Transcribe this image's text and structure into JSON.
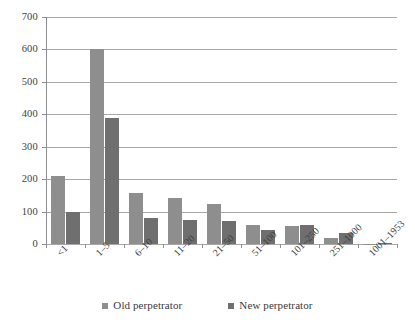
{
  "chart_data": {
    "type": "bar",
    "title": "",
    "subtitle": "",
    "xlabel": "",
    "ylabel": "",
    "ylim": [
      0,
      700
    ],
    "yticks": [
      0,
      100,
      200,
      300,
      400,
      500,
      600,
      700
    ],
    "grid": true,
    "legend_position": "bottom",
    "categories": [
      "<1",
      "1–5",
      "6–10",
      "11–20",
      "21–50",
      "51–100",
      "101–250",
      "251–1000",
      "1001–1953"
    ],
    "series": [
      {
        "name": "Old perpetrator",
        "color": "#8e8e8e",
        "values": [
          210,
          600,
          158,
          141,
          123,
          58,
          55,
          20,
          1
        ]
      },
      {
        "name": "New perpetrator",
        "color": "#6f6f6f",
        "values": [
          100,
          390,
          80,
          75,
          70,
          42,
          60,
          33,
          2
        ]
      }
    ]
  },
  "axis": {
    "tick_labels": [
      "0",
      "100",
      "200",
      "300",
      "400",
      "500",
      "600",
      "700"
    ]
  },
  "colors": {
    "old_perpetrator": "#8e8e8e",
    "new_perpetrator": "#6f6f6f",
    "gridline": "#a8a8a8",
    "axis": "#8f8f8f",
    "text": "#3a3a3a",
    "background": "#ffffff"
  }
}
